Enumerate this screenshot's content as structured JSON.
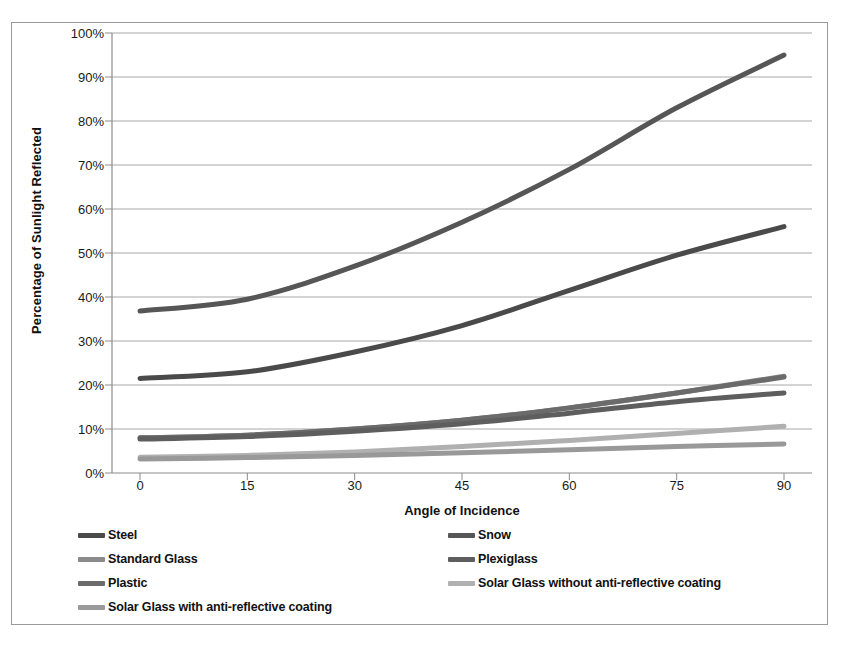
{
  "chart_data": {
    "type": "line",
    "title": "",
    "xlabel": "Angle of Incidence",
    "ylabel": "Percentage of Sunlight Reflected",
    "x": [
      0,
      15,
      30,
      45,
      60,
      75,
      90
    ],
    "x_tick_labels": [
      "0",
      "15",
      "30",
      "45",
      "60",
      "75",
      "90"
    ],
    "y_tick_labels": [
      "0%",
      "10%",
      "20%",
      "30%",
      "40%",
      "50%",
      "60%",
      "70%",
      "80%",
      "90%",
      "100%"
    ],
    "y_ticks": [
      0,
      10,
      20,
      30,
      40,
      50,
      60,
      70,
      80,
      90,
      100
    ],
    "ylim": [
      0,
      100
    ],
    "grid": "horizontal",
    "legend_position": "bottom",
    "series": [
      {
        "name": "Steel",
        "values": [
          21.5,
          23.0,
          27.5,
          33.5,
          41.5,
          49.5,
          56.0
        ],
        "color": "#4a4a4a"
      },
      {
        "name": "Snow",
        "values": [
          36.8,
          39.5,
          47.0,
          57.0,
          69.0,
          83.0,
          95.0
        ],
        "color": "#565656"
      },
      {
        "name": "Standard Glass",
        "values": [
          8.0,
          8.6,
          10.0,
          12.0,
          14.8,
          18.2,
          22.0
        ],
        "color": "#8a8a8a"
      },
      {
        "name": "Plexiglass",
        "values": [
          7.7,
          8.3,
          9.5,
          11.2,
          13.6,
          16.2,
          18.2
        ],
        "color": "#5e5e5e"
      },
      {
        "name": "Plastic",
        "values": [
          8.0,
          8.6,
          10.0,
          12.0,
          14.8,
          18.2,
          21.8
        ],
        "color": "#6b6b6b"
      },
      {
        "name": "Solar Glass without anti-reflective coating",
        "values": [
          3.6,
          4.0,
          4.8,
          6.0,
          7.4,
          9.0,
          10.6
        ],
        "color": "#b0b0b0"
      },
      {
        "name": "Solar Glass with anti-reflective coating",
        "values": [
          3.2,
          3.5,
          4.0,
          4.6,
          5.3,
          6.0,
          6.6
        ],
        "color": "#999999"
      }
    ]
  },
  "legend": {
    "rows": [
      [
        {
          "label": "Steel",
          "color": "#4a4a4a"
        },
        {
          "label": "Snow",
          "color": "#565656"
        }
      ],
      [
        {
          "label": "Standard Glass",
          "color": "#8a8a8a"
        },
        {
          "label": "Plexiglass",
          "color": "#5e5e5e"
        }
      ],
      [
        {
          "label": "Plastic",
          "color": "#6b6b6b"
        },
        {
          "label": "Solar Glass without anti-reflective coating",
          "color": "#b0b0b0"
        }
      ],
      [
        {
          "label": "Solar Glass with anti-reflective coating",
          "color": "#999999"
        }
      ]
    ]
  },
  "style": {
    "grid_color": "#9e9e9e",
    "axis_color": "#8c8c8c",
    "frame_color": "#9a9a9a",
    "background": "#ffffff",
    "text_color": "#111111"
  }
}
